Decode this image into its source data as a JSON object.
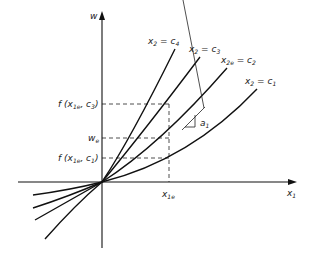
{
  "axes": {
    "y_label": "w",
    "x_label_main": "x",
    "x_label_sub": "1"
  },
  "curves": [
    {
      "label_main": "x",
      "label_sub": "2",
      "label_rest": " = c",
      "label_rest_sub": "4"
    },
    {
      "label_main": "x",
      "label_sub": "2",
      "label_rest": " = c",
      "label_rest_sub": "3"
    },
    {
      "label_main": "x",
      "label_sub": "2e",
      "label_rest": " = c",
      "label_rest_sub": "2"
    },
    {
      "label_main": "x",
      "label_sub": "2",
      "label_rest": " = c",
      "label_rest_sub": "1"
    }
  ],
  "y_ticks": {
    "f_c3": {
      "pre": "f (x",
      "sub": "1e",
      "post": ", c",
      "post_sub": "3",
      "close": ")"
    },
    "we": {
      "main": "w",
      "sub": "e"
    },
    "f_c1": {
      "pre": "f (x",
      "sub": "1e",
      "post": ", c",
      "post_sub": "1",
      "close": ")"
    }
  },
  "x_ticks": {
    "x1e": {
      "main": "x",
      "sub": "1e"
    }
  },
  "slope": {
    "main": "a",
    "sub": "1"
  }
}
